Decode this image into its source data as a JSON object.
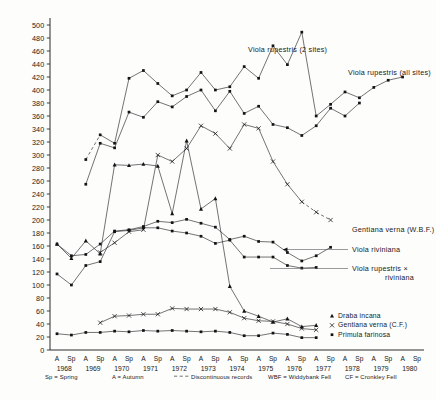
{
  "figure": {
    "title": "",
    "ylabel": "",
    "xlabel": ""
  },
  "axes": {
    "y_ticks": [
      0,
      20,
      40,
      60,
      80,
      100,
      120,
      140,
      160,
      180,
      200,
      220,
      240,
      260,
      280,
      300,
      320,
      340,
      360,
      380,
      400,
      420,
      440,
      460,
      480,
      500
    ],
    "y_min": 0,
    "y_max": 500,
    "x_years": [
      "1968",
      "1969",
      "1970",
      "1971",
      "1972",
      "1973",
      "1974",
      "1975",
      "1976",
      "1977",
      "1978",
      "1979",
      "1980"
    ],
    "x_seasons": [
      "A",
      "Sp",
      "A",
      "Sp",
      "A",
      "Sp",
      "A",
      "Sp",
      "A",
      "Sp",
      "A",
      "Sp",
      "A",
      "Sp",
      "A",
      "Sp",
      "A",
      "Sp",
      "A",
      "Sp",
      "A",
      "Sp",
      "A",
      "Sp",
      "A",
      "Sp"
    ]
  },
  "annotations": [
    {
      "name": "viola-rupestris-2-sites",
      "text": "Viola rupestris (2 sites)"
    },
    {
      "name": "viola-rupestris-all-sites",
      "text": "Viola rupestris (all sites)"
    },
    {
      "name": "gentiana-verna-wbf",
      "text": "Gentiana verna (W.B.F.)"
    },
    {
      "name": "viola-riviniana",
      "text": "Viola riviniana"
    },
    {
      "name": "viola-rupestris-x",
      "text": "Viola rupestris  ×"
    },
    {
      "name": "viola-rupestris-x-2",
      "text": "riviniana"
    }
  ],
  "legend": {
    "position": "bottom-right",
    "items": [
      {
        "marker": "triangle",
        "label": "Draba incana"
      },
      {
        "marker": "cross",
        "label": "Gentiana verna (C.F.)"
      },
      {
        "marker": "square",
        "label": "Primula farinosa"
      }
    ]
  },
  "footnotes": [
    {
      "name": "sp-spring",
      "text": "Sp = Spring"
    },
    {
      "name": "a-autumn",
      "text": "A = Autumn"
    },
    {
      "name": "discontinuous",
      "text": "Discontinuous records"
    },
    {
      "name": "wbf",
      "text": "WBF = Widdybank Fell"
    },
    {
      "name": "cf",
      "text": "CF = Cronkley Fell"
    }
  ],
  "chart_data": {
    "type": "line",
    "title": "",
    "xlabel": "",
    "ylabel": "",
    "ylim": [
      0,
      500
    ],
    "grid": false,
    "legend_position": "bottom-right",
    "x": [
      "1968 A",
      "1968 Sp",
      "1969 A",
      "1969 Sp",
      "1970 A",
      "1970 Sp",
      "1971 A",
      "1971 Sp",
      "1972 A",
      "1972 Sp",
      "1973 A",
      "1973 Sp",
      "1974 A",
      "1974 Sp",
      "1975 A",
      "1975 Sp",
      "1976 A",
      "1976 Sp",
      "1977 A",
      "1977 Sp",
      "1978 A",
      "1978 Sp",
      "1979 A",
      "1979 Sp",
      "1980 A",
      "1980 Sp"
    ],
    "series": [
      {
        "name": "Viola rupestris (all sites)",
        "marker": "square",
        "style": "solid-then-dashed",
        "dashed_from_index": 16,
        "points": [
          {
            "x": "1969 A",
            "y": 293,
            "dashed": true
          },
          {
            "x": "1969 Sp",
            "y": 331,
            "dashed": true
          },
          {
            "x": "1970 A",
            "y": 318
          },
          {
            "x": "1970 Sp",
            "y": 418
          },
          {
            "x": "1971 A",
            "y": 430
          },
          {
            "x": "1971 Sp",
            "y": 410
          },
          {
            "x": "1972 A",
            "y": 391
          },
          {
            "x": "1972 Sp",
            "y": 400
          },
          {
            "x": "1973 A",
            "y": 427
          },
          {
            "x": "1973 Sp",
            "y": 400
          },
          {
            "x": "1974 A",
            "y": 405
          },
          {
            "x": "1974 Sp",
            "y": 436
          },
          {
            "x": "1975 A",
            "y": 418
          },
          {
            "x": "1975 Sp",
            "y": 468
          },
          {
            "x": "1976 A",
            "y": 439
          },
          {
            "x": "1976 Sp",
            "y": 489
          },
          {
            "x": "1977 A",
            "y": 360
          },
          {
            "x": "1977 Sp",
            "y": 378
          },
          {
            "x": "1978 A",
            "y": 397
          },
          {
            "x": "1978 Sp",
            "y": 388
          },
          {
            "x": "1979 A",
            "y": 404
          },
          {
            "x": "1979 Sp",
            "y": 415
          },
          {
            "x": "1980 A",
            "y": 420
          }
        ]
      },
      {
        "name": "Viola rupestris (2 sites)",
        "marker": "square",
        "style": "solid",
        "points": [
          {
            "x": "1969 A",
            "y": 255
          },
          {
            "x": "1969 Sp",
            "y": 318
          },
          {
            "x": "1970 A",
            "y": 311
          },
          {
            "x": "1970 Sp",
            "y": 366
          },
          {
            "x": "1971 A",
            "y": 358
          },
          {
            "x": "1971 Sp",
            "y": 382
          },
          {
            "x": "1972 A",
            "y": 374
          },
          {
            "x": "1972 Sp",
            "y": 390
          },
          {
            "x": "1973 A",
            "y": 400
          },
          {
            "x": "1973 Sp",
            "y": 368
          },
          {
            "x": "1974 A",
            "y": 398
          },
          {
            "x": "1974 Sp",
            "y": 364
          },
          {
            "x": "1975 A",
            "y": 375
          },
          {
            "x": "1975 Sp",
            "y": 347
          },
          {
            "x": "1976 A",
            "y": 342
          },
          {
            "x": "1976 Sp",
            "y": 330
          },
          {
            "x": "1977 A",
            "y": 345
          },
          {
            "x": "1977 Sp",
            "y": 372
          },
          {
            "x": "1978 A",
            "y": 360
          },
          {
            "x": "1978 Sp",
            "y": 380
          }
        ]
      },
      {
        "name": "Gentiana verna (W.B.F.)",
        "marker": "cross",
        "style": "solid-then-dashed",
        "dashed_from_index": 14,
        "points": [
          {
            "x": "1969 Sp",
            "y": 150
          },
          {
            "x": "1970 A",
            "y": 165
          },
          {
            "x": "1970 Sp",
            "y": 182
          },
          {
            "x": "1971 A",
            "y": 185
          },
          {
            "x": "1971 Sp",
            "y": 300
          },
          {
            "x": "1972 A",
            "y": 290
          },
          {
            "x": "1972 Sp",
            "y": 310
          },
          {
            "x": "1973 A",
            "y": 345
          },
          {
            "x": "1973 Sp",
            "y": 333
          },
          {
            "x": "1974 A",
            "y": 310
          },
          {
            "x": "1974 Sp",
            "y": 347
          },
          {
            "x": "1975 A",
            "y": 341
          },
          {
            "x": "1975 Sp",
            "y": 290
          },
          {
            "x": "1976 A",
            "y": 255
          },
          {
            "x": "1976 Sp",
            "y": 228,
            "dashed": true
          },
          {
            "x": "1977 A",
            "y": 212,
            "dashed": true
          },
          {
            "x": "1977 Sp",
            "y": 200,
            "dashed": true
          }
        ]
      },
      {
        "name": "Viola riviniana",
        "marker": "square",
        "style": "solid",
        "points": [
          {
            "x": "1968 A",
            "y": 163
          },
          {
            "x": "1968 Sp",
            "y": 145
          },
          {
            "x": "1969 A",
            "y": 147
          },
          {
            "x": "1969 Sp",
            "y": 163
          },
          {
            "x": "1970 A",
            "y": 183
          },
          {
            "x": "1970 Sp",
            "y": 185
          },
          {
            "x": "1971 A",
            "y": 190
          },
          {
            "x": "1971 Sp",
            "y": 198
          },
          {
            "x": "1972 A",
            "y": 196
          },
          {
            "x": "1972 Sp",
            "y": 201
          },
          {
            "x": "1973 A",
            "y": 195
          },
          {
            "x": "1973 Sp",
            "y": 189
          },
          {
            "x": "1974 A",
            "y": 170
          },
          {
            "x": "1974 Sp",
            "y": 175
          },
          {
            "x": "1975 A",
            "y": 167
          },
          {
            "x": "1975 Sp",
            "y": 166
          },
          {
            "x": "1976 A",
            "y": 150
          },
          {
            "x": "1976 Sp",
            "y": 137
          },
          {
            "x": "1977 A",
            "y": 145
          },
          {
            "x": "1977 Sp",
            "y": 158
          }
        ]
      },
      {
        "name": "Viola rupestris × riviniana",
        "marker": "square",
        "style": "solid",
        "points": [
          {
            "x": "1968 A",
            "y": 117
          },
          {
            "x": "1968 Sp",
            "y": 100
          },
          {
            "x": "1969 A",
            "y": 130
          },
          {
            "x": "1969 Sp",
            "y": 136
          },
          {
            "x": "1970 A",
            "y": 182
          },
          {
            "x": "1970 Sp",
            "y": 184
          },
          {
            "x": "1971 A",
            "y": 188
          },
          {
            "x": "1971 Sp",
            "y": 188
          },
          {
            "x": "1972 A",
            "y": 183
          },
          {
            "x": "1972 Sp",
            "y": 180
          },
          {
            "x": "1973 A",
            "y": 175
          },
          {
            "x": "1973 Sp",
            "y": 164
          },
          {
            "x": "1974 A",
            "y": 169
          },
          {
            "x": "1974 Sp",
            "y": 143
          },
          {
            "x": "1975 A",
            "y": 143
          },
          {
            "x": "1975 Sp",
            "y": 143
          },
          {
            "x": "1976 A",
            "y": 130
          },
          {
            "x": "1976 Sp",
            "y": 126
          },
          {
            "x": "1977 A",
            "y": 127
          }
        ]
      },
      {
        "name": "Draba incana",
        "marker": "triangle",
        "style": "solid",
        "points": [
          {
            "x": "1968 A",
            "y": 163
          },
          {
            "x": "1968 Sp",
            "y": 141
          },
          {
            "x": "1969 A",
            "y": 168
          },
          {
            "x": "1969 Sp",
            "y": 148
          },
          {
            "x": "1970 A",
            "y": 285
          },
          {
            "x": "1970 Sp",
            "y": 284
          },
          {
            "x": "1971 A",
            "y": 286
          },
          {
            "x": "1971 Sp",
            "y": 283
          },
          {
            "x": "1972 A",
            "y": 210
          },
          {
            "x": "1972 Sp",
            "y": 322
          },
          {
            "x": "1973 A",
            "y": 217
          },
          {
            "x": "1973 Sp",
            "y": 233
          },
          {
            "x": "1974 A",
            "y": 98
          },
          {
            "x": "1974 Sp",
            "y": 60
          },
          {
            "x": "1975 A",
            "y": 52
          },
          {
            "x": "1975 Sp",
            "y": 43
          },
          {
            "x": "1976 A",
            "y": 48
          },
          {
            "x": "1976 Sp",
            "y": 36
          },
          {
            "x": "1977 A",
            "y": 38
          }
        ]
      },
      {
        "name": "Gentiana verna (C.F.)",
        "marker": "cross",
        "style": "solid",
        "points": [
          {
            "x": "1969 Sp",
            "y": 42
          },
          {
            "x": "1970 A",
            "y": 52
          },
          {
            "x": "1970 Sp",
            "y": 53
          },
          {
            "x": "1971 A",
            "y": 55
          },
          {
            "x": "1971 Sp",
            "y": 55
          },
          {
            "x": "1972 A",
            "y": 64
          },
          {
            "x": "1972 Sp",
            "y": 63
          },
          {
            "x": "1973 A",
            "y": 63
          },
          {
            "x": "1973 Sp",
            "y": 63
          },
          {
            "x": "1974 A",
            "y": 58
          },
          {
            "x": "1974 Sp",
            "y": 49
          },
          {
            "x": "1975 A",
            "y": 45
          },
          {
            "x": "1975 Sp",
            "y": 44
          },
          {
            "x": "1976 A",
            "y": 40
          },
          {
            "x": "1976 Sp",
            "y": 33
          },
          {
            "x": "1977 A",
            "y": 31
          }
        ]
      },
      {
        "name": "Primula farinosa",
        "marker": "square",
        "style": "solid",
        "points": [
          {
            "x": "1968 A",
            "y": 25
          },
          {
            "x": "1968 Sp",
            "y": 23
          },
          {
            "x": "1969 A",
            "y": 27
          },
          {
            "x": "1969 Sp",
            "y": 27
          },
          {
            "x": "1970 A",
            "y": 29
          },
          {
            "x": "1970 Sp",
            "y": 28
          },
          {
            "x": "1971 A",
            "y": 30
          },
          {
            "x": "1971 Sp",
            "y": 29
          },
          {
            "x": "1972 A",
            "y": 30
          },
          {
            "x": "1972 Sp",
            "y": 29
          },
          {
            "x": "1973 A",
            "y": 28
          },
          {
            "x": "1973 Sp",
            "y": 29
          },
          {
            "x": "1974 A",
            "y": 27
          },
          {
            "x": "1974 Sp",
            "y": 22
          },
          {
            "x": "1975 A",
            "y": 22
          },
          {
            "x": "1975 Sp",
            "y": 26
          },
          {
            "x": "1976 A",
            "y": 24
          },
          {
            "x": "1976 Sp",
            "y": 19
          },
          {
            "x": "1977 A",
            "y": 19
          }
        ]
      }
    ]
  }
}
